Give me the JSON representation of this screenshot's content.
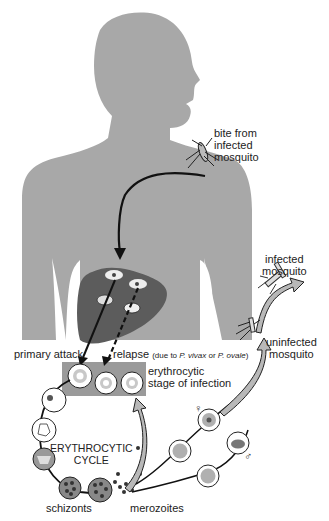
{
  "diagram": {
    "topic": "Malaria parasite life cycle",
    "labels": {
      "bite": [
        "bite from",
        "infected",
        "mosquito"
      ],
      "infected_mosquito": [
        "infected",
        "mosquito"
      ],
      "uninfected_mosquito": [
        "uninfected",
        "mosquito"
      ],
      "primary_attack": "primary attack",
      "relapse": "relapse",
      "relapse_note_prefix": "(due to ",
      "relapse_species1": "P. vivax",
      "relapse_or": " or ",
      "relapse_species2": "P. ovale",
      "relapse_note_suffix": ")",
      "erythrocytic_stage": [
        "erythrocytic",
        "stage of infection"
      ],
      "cycle": [
        "ERYTHROCYTIC",
        "CYCLE"
      ],
      "schizonts": "schizonts",
      "merozoites": "merozoites",
      "female_symbol": "♀",
      "male_symbol": "♂"
    },
    "colors": {
      "body": "#a8a8a8",
      "liver": "#5c5c5c",
      "erythrocytic_box": "#9a9a9a",
      "cell_fill": "#ffffff",
      "cell_ring": "#c8c8c8",
      "arrow_fill": "#b8b8b8",
      "line": "#111111"
    }
  }
}
